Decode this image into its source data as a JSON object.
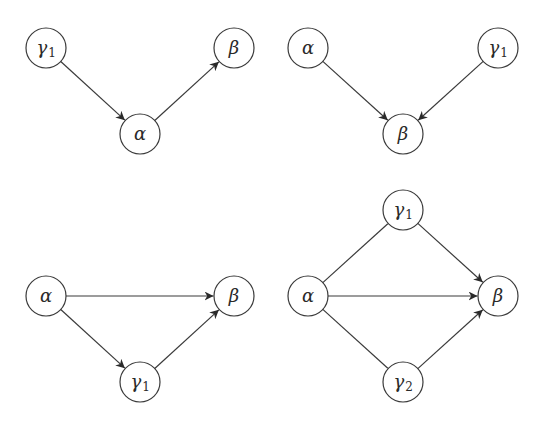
{
  "style": {
    "node_radius": 20,
    "stroke_color": "#3a3a3a",
    "background": "#ffffff"
  },
  "diagrams": [
    {
      "name": "top-left",
      "nodes": [
        {
          "id": "g1",
          "symbol": "γ",
          "sub": "1",
          "x": 46,
          "y": 48
        },
        {
          "id": "a",
          "symbol": "α",
          "sub": "",
          "x": 140,
          "y": 134
        },
        {
          "id": "b",
          "symbol": "β",
          "sub": "",
          "x": 234,
          "y": 48
        }
      ],
      "edges": [
        {
          "from": "g1",
          "to": "a",
          "directed": true
        },
        {
          "from": "a",
          "to": "b",
          "directed": true
        }
      ]
    },
    {
      "name": "top-right",
      "nodes": [
        {
          "id": "a",
          "symbol": "α",
          "sub": "",
          "x": 308,
          "y": 48
        },
        {
          "id": "g1",
          "symbol": "γ",
          "sub": "1",
          "x": 498,
          "y": 48
        },
        {
          "id": "b",
          "symbol": "β",
          "sub": "",
          "x": 403,
          "y": 134
        }
      ],
      "edges": [
        {
          "from": "a",
          "to": "b",
          "directed": true
        },
        {
          "from": "g1",
          "to": "b",
          "directed": true
        }
      ]
    },
    {
      "name": "bottom-left",
      "nodes": [
        {
          "id": "a",
          "symbol": "α",
          "sub": "",
          "x": 46,
          "y": 296
        },
        {
          "id": "b",
          "symbol": "β",
          "sub": "",
          "x": 234,
          "y": 296
        },
        {
          "id": "g1",
          "symbol": "γ",
          "sub": "1",
          "x": 140,
          "y": 382
        }
      ],
      "edges": [
        {
          "from": "a",
          "to": "b",
          "directed": true
        },
        {
          "from": "a",
          "to": "g1",
          "directed": true
        },
        {
          "from": "g1",
          "to": "b",
          "directed": true
        }
      ]
    },
    {
      "name": "bottom-right",
      "nodes": [
        {
          "id": "a",
          "symbol": "α",
          "sub": "",
          "x": 308,
          "y": 296
        },
        {
          "id": "b",
          "symbol": "β",
          "sub": "",
          "x": 498,
          "y": 296
        },
        {
          "id": "g1",
          "symbol": "γ",
          "sub": "1",
          "x": 403,
          "y": 210
        },
        {
          "id": "g2",
          "symbol": "γ",
          "sub": "2",
          "x": 403,
          "y": 382
        }
      ],
      "edges": [
        {
          "from": "a",
          "to": "g1",
          "directed": false
        },
        {
          "from": "a",
          "to": "g2",
          "directed": false
        },
        {
          "from": "a",
          "to": "b",
          "directed": true
        },
        {
          "from": "g1",
          "to": "b",
          "directed": true
        },
        {
          "from": "g2",
          "to": "b",
          "directed": true
        }
      ]
    }
  ]
}
